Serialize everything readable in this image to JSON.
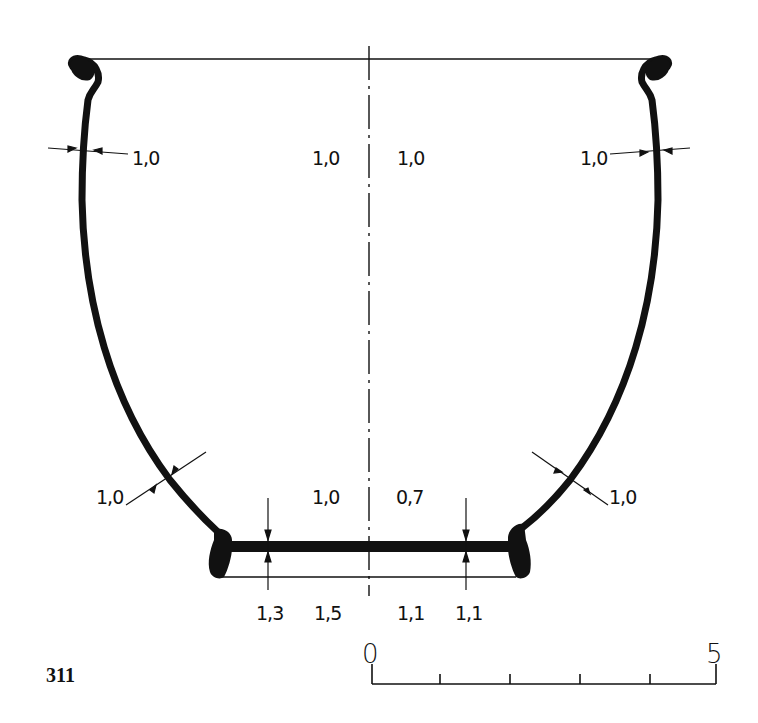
{
  "figure": {
    "number": "311",
    "type": "vessel profile drawing",
    "colors": {
      "ink": "#111111",
      "background": "#ffffff"
    }
  },
  "measurements": {
    "left_upper_wall": "1,0",
    "center_upper_left": "1,0",
    "center_upper_right": "1,0",
    "right_upper_wall": "1,0",
    "left_lower_wall": "1,0",
    "center_lower_left": "1,0",
    "center_lower_right": "0,7",
    "right_lower_wall": "1,0",
    "base_left_1": "1,3",
    "base_left_2": "1,5",
    "base_right_1": "1,1",
    "base_right_2": "1,1"
  },
  "scale_bar": {
    "start_label": "0",
    "end_label": "5",
    "divisions": 5
  }
}
